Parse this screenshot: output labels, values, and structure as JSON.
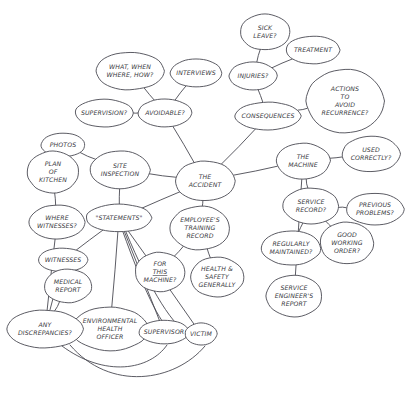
{
  "diagram": {
    "kind": "hand-drawn-mind-map",
    "style": {
      "stroke": "#4a4a52",
      "node_fill": "#ffffff",
      "label_color": "#3a3a42",
      "background": "#ffffff"
    },
    "nodes": [
      {
        "id": "sick_leave",
        "label": "SICK\nLEAVE?",
        "cx": 265,
        "cy": 32,
        "rx": 25,
        "ry": 18,
        "font": 6.2
      },
      {
        "id": "treatment",
        "label": "TREATMENT",
        "cx": 313,
        "cy": 50,
        "rx": 27,
        "ry": 14,
        "font": 6.2
      },
      {
        "id": "what_when",
        "label": "WHAT, WHEN\nWHERE, HOW?",
        "cx": 130,
        "cy": 71,
        "rx": 34,
        "ry": 19,
        "font": 6.2
      },
      {
        "id": "interviews",
        "label": "INTERVIEWS",
        "cx": 196,
        "cy": 73,
        "rx": 26,
        "ry": 14,
        "font": 6.2
      },
      {
        "id": "injuries",
        "label": "INJURIES?",
        "cx": 253,
        "cy": 76,
        "rx": 24,
        "ry": 14,
        "font": 6.2
      },
      {
        "id": "actions",
        "label": "ACTIONS\nTO\nAVOID\nRECURRENCE?",
        "cx": 345,
        "cy": 101,
        "rx": 39,
        "ry": 32,
        "font": 6.2
      },
      {
        "id": "supervision",
        "label": "SUPERVISION?",
        "cx": 104,
        "cy": 113,
        "rx": 29,
        "ry": 14,
        "font": 6.2
      },
      {
        "id": "avoidable",
        "label": "AVOIDABLE?",
        "cx": 165,
        "cy": 113,
        "rx": 27,
        "ry": 14,
        "font": 6.2
      },
      {
        "id": "consequences",
        "label": "CONSEQUENCES",
        "cx": 268,
        "cy": 116,
        "rx": 33,
        "ry": 14,
        "font": 6.2
      },
      {
        "id": "photos",
        "label": "PHOTOS",
        "cx": 63,
        "cy": 145,
        "rx": 22,
        "ry": 12,
        "font": 6.2
      },
      {
        "id": "the_machine",
        "label": "THE\nMACHINE",
        "cx": 303,
        "cy": 161,
        "rx": 27,
        "ry": 18,
        "font": 6.2
      },
      {
        "id": "used_correctly",
        "label": "USED\nCORRECTLY?",
        "cx": 371,
        "cy": 154,
        "rx": 29,
        "ry": 18,
        "font": 6.2
      },
      {
        "id": "plan_kitchen",
        "label": "PLAN\nOF\nKITCHEN",
        "cx": 53,
        "cy": 172,
        "rx": 26,
        "ry": 21,
        "font": 6.2
      },
      {
        "id": "site_inspection",
        "label": "SITE\nINSPECTION",
        "cx": 120,
        "cy": 170,
        "rx": 30,
        "ry": 19,
        "font": 6.2
      },
      {
        "id": "the_accident",
        "label": "THE\nACCIDENT",
        "cx": 205,
        "cy": 181,
        "rx": 30,
        "ry": 20,
        "font": 6.2
      },
      {
        "id": "service_record",
        "label": "SERVICE\nRECORD?",
        "cx": 311,
        "cy": 206,
        "rx": 28,
        "ry": 18,
        "font": 6.2
      },
      {
        "id": "previous_problems",
        "label": "PREVIOUS\nPROBLEMS?",
        "cx": 375,
        "cy": 209,
        "rx": 29,
        "ry": 16,
        "font": 6.2
      },
      {
        "id": "where_witnesses",
        "label": "WHERE\nWITNESSES?",
        "cx": 57,
        "cy": 222,
        "rx": 28,
        "ry": 17,
        "font": 6.2
      },
      {
        "id": "statements",
        "label": "\"STATEMENTS\"",
        "cx": 119,
        "cy": 218,
        "rx": 33,
        "ry": 14,
        "font": 6.2
      },
      {
        "id": "employee_training",
        "label": "EMPLOYEE'S\nTRAINING\nRECORD",
        "cx": 200,
        "cy": 228,
        "rx": 30,
        "ry": 22,
        "font": 6.2
      },
      {
        "id": "good_working",
        "label": "GOOD\nWORKING\nORDER?",
        "cx": 347,
        "cy": 243,
        "rx": 27,
        "ry": 21,
        "font": 6.2
      },
      {
        "id": "regularly_maint",
        "label": "REGULARLY\nMAINTAINED?",
        "cx": 291,
        "cy": 248,
        "rx": 30,
        "ry": 17,
        "font": 6.2
      },
      {
        "id": "for_this_machine",
        "label": "FOR\nTHIS\nMACHINE?",
        "cx": 160,
        "cy": 272,
        "rx": 25,
        "ry": 20,
        "font": 6.2,
        "underline_line": 1
      },
      {
        "id": "health_safety",
        "label": "HEALTH &\nSAFETY\nGENERALLY",
        "cx": 217,
        "cy": 277,
        "rx": 27,
        "ry": 20,
        "font": 6.2
      },
      {
        "id": "witnesses",
        "label": "WITNESSES",
        "cx": 63,
        "cy": 260,
        "rx": 25,
        "ry": 12,
        "font": 6.2
      },
      {
        "id": "medical_report",
        "label": "MEDICAL\nREPORT",
        "cx": 68,
        "cy": 286,
        "rx": 24,
        "ry": 17,
        "font": 6.2
      },
      {
        "id": "service_engineer",
        "label": "SERVICE\nENGINEER'S\nREPORT",
        "cx": 294,
        "cy": 296,
        "rx": 28,
        "ry": 21,
        "font": 6.2
      },
      {
        "id": "env_health",
        "label": "ENVIRONMENTAL\nHEALTH\nOFFICER",
        "cx": 110,
        "cy": 329,
        "rx": 38,
        "ry": 22,
        "font": 6.2
      },
      {
        "id": "any_discrepancies",
        "label": "ANY\nDISCREPANCIES?",
        "cx": 45,
        "cy": 329,
        "rx": 38,
        "ry": 19,
        "font": 6.2
      },
      {
        "id": "supervisor",
        "label": "SUPERVISOR",
        "cx": 164,
        "cy": 332,
        "rx": 25,
        "ry": 12,
        "font": 6.2
      },
      {
        "id": "victim",
        "label": "VICTIM",
        "cx": 201,
        "cy": 334,
        "rx": 16,
        "ry": 11,
        "font": 6.2
      }
    ],
    "edges": [
      {
        "from": "sick_leave",
        "to": "injuries"
      },
      {
        "from": "treatment",
        "to": "injuries"
      },
      {
        "from": "injuries",
        "to": "consequences"
      },
      {
        "from": "what_when",
        "to": "avoidable"
      },
      {
        "from": "interviews",
        "to": "avoidable"
      },
      {
        "from": "supervision",
        "to": "avoidable"
      },
      {
        "from": "avoidable",
        "to": "the_accident"
      },
      {
        "from": "consequences",
        "to": "actions"
      },
      {
        "from": "consequences",
        "to": "the_accident"
      },
      {
        "from": "photos",
        "to": "site_inspection"
      },
      {
        "from": "plan_kitchen",
        "to": "where_witnesses"
      },
      {
        "from": "site_inspection",
        "to": "the_accident"
      },
      {
        "from": "site_inspection",
        "to": "statements"
      },
      {
        "from": "the_accident",
        "to": "the_machine"
      },
      {
        "from": "the_accident",
        "to": "statements"
      },
      {
        "from": "the_accident",
        "to": "employee_training"
      },
      {
        "from": "the_machine",
        "to": "used_correctly"
      },
      {
        "from": "the_machine",
        "to": "service_record"
      },
      {
        "from": "the_machine",
        "to": "service_engineer"
      },
      {
        "from": "service_record",
        "to": "previous_problems"
      },
      {
        "from": "service_record",
        "to": "good_working"
      },
      {
        "from": "service_record",
        "to": "regularly_maint"
      },
      {
        "from": "employee_training",
        "to": "for_this_machine"
      },
      {
        "from": "employee_training",
        "to": "health_safety"
      },
      {
        "from": "statements",
        "to": "witnesses"
      },
      {
        "from": "statements",
        "to": "env_health"
      },
      {
        "from": "statements",
        "to": "supervisor"
      },
      {
        "from": "statements",
        "to": "victim"
      },
      {
        "from": "witnesses",
        "to": "any_discrepancies"
      },
      {
        "from": "medical_report",
        "to": "any_discrepancies"
      },
      {
        "from": "where_witnesses",
        "to": "any_discrepancies"
      },
      {
        "from": "env_health",
        "to": "any_discrepancies"
      }
    ],
    "curved_edges": [
      {
        "id": "disc-to-victim",
        "d": "M 70,345 C 110,392 175,382 205,346"
      },
      {
        "id": "disc-to-supervisor",
        "d": "M 62,346 C 105,378 150,370 167,345"
      },
      {
        "id": "statements-fan-1",
        "d": "M 126,232 C 150,290 175,330 190,334"
      },
      {
        "id": "statements-fan-2",
        "d": "M 123,232 C 142,285 160,325 172,332"
      }
    ]
  }
}
